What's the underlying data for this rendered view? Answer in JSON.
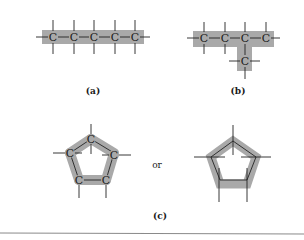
{
  "figure": {
    "panels": [
      {
        "id": "a",
        "label": "(a)",
        "description": "Straight carbon chain",
        "atoms": [
          "C",
          "C",
          "C",
          "C",
          "C"
        ]
      },
      {
        "id": "b",
        "label": "(b)",
        "description": "Branched carbon chain",
        "atoms": [
          "C",
          "C",
          "C",
          "C",
          "C"
        ]
      },
      {
        "id": "c",
        "label": "(c)",
        "description": "Ring of carbon atoms",
        "atoms": [
          "C",
          "C",
          "C",
          "C",
          "C"
        ],
        "connector": "or"
      }
    ],
    "colors": {
      "highlight": "#a9a9a9",
      "line": "#222222",
      "rule": "#888888"
    }
  }
}
